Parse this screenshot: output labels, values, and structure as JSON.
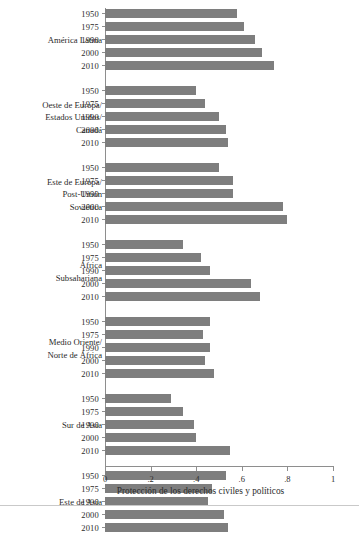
{
  "chart_data": {
    "type": "bar",
    "orientation": "horizontal",
    "title": "",
    "xlabel": "Protección de los derechos civiles y políticos",
    "ylabel": "",
    "xlim": [
      0,
      1
    ],
    "xticks": [
      0,
      0.2,
      0.4,
      0.6,
      0.8,
      1
    ],
    "xtick_labels": [
      "0",
      ".2",
      ".4",
      ".6",
      ".8",
      "1"
    ],
    "grid": false,
    "legend": null,
    "bar_color": "#7e7e7e",
    "categories": [
      "1950",
      "1975",
      "1990",
      "2000",
      "2010"
    ],
    "groups": [
      {
        "label": "América Latina",
        "values": [
          0.58,
          0.61,
          0.66,
          0.69,
          0.74
        ]
      },
      {
        "label": "Oeste de Europa/\nEstados Unidos/\nCanadá",
        "values": [
          0.4,
          0.44,
          0.5,
          0.53,
          0.54
        ]
      },
      {
        "label": "Este de Europa/\nPost-Unión\nSoviética",
        "values": [
          0.5,
          0.56,
          0.56,
          0.78,
          0.8
        ]
      },
      {
        "label": "África\nSubsahariana",
        "values": [
          0.34,
          0.42,
          0.46,
          0.64,
          0.68
        ]
      },
      {
        "label": "Medio Oriente/\nNorte de África",
        "values": [
          0.46,
          0.43,
          0.46,
          0.44,
          0.48
        ]
      },
      {
        "label": "Sur de Asia",
        "values": [
          0.29,
          0.34,
          0.39,
          0.4,
          0.55
        ]
      },
      {
        "label": "Este de Asia",
        "values": [
          0.53,
          0.47,
          0.45,
          0.52,
          0.54
        ]
      }
    ]
  }
}
